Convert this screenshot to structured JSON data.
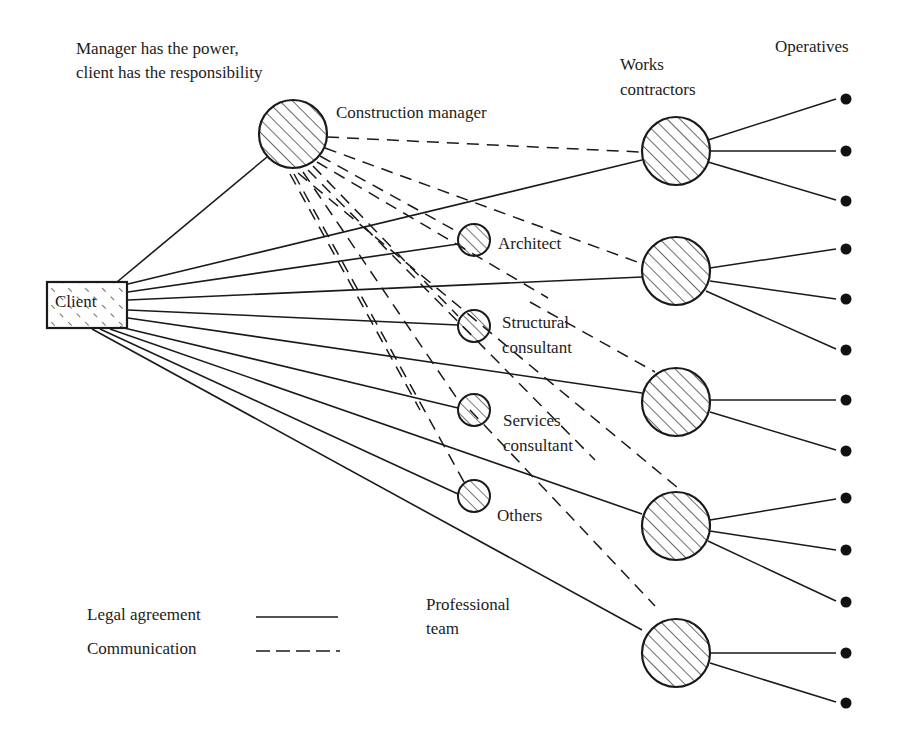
{
  "diagram": {
    "caption": {
      "line1": "Manager has the power,",
      "line2": "client has the responsibility"
    },
    "nodes": {
      "client": "Client",
      "construction_manager": "Construction manager",
      "works_contractors": {
        "line1": "Works",
        "line2": "contractors"
      },
      "operatives": "Operatives",
      "architect": "Architect",
      "structural_consultant": {
        "line1": "Structural",
        "line2": "consultant"
      },
      "services_consultant": {
        "line1": "Services",
        "line2": "consultant"
      },
      "others": "Others",
      "professional_team": {
        "line1": "Professional",
        "line2": "team"
      }
    },
    "legend": {
      "legal_agreement": "Legal agreement",
      "communication": "Communication"
    },
    "counts": {
      "works_contractors": 5,
      "professional_consultants": 4,
      "operatives": 13
    },
    "colors": {
      "ink": "#1a1a1a",
      "background": "#ffffff"
    }
  }
}
